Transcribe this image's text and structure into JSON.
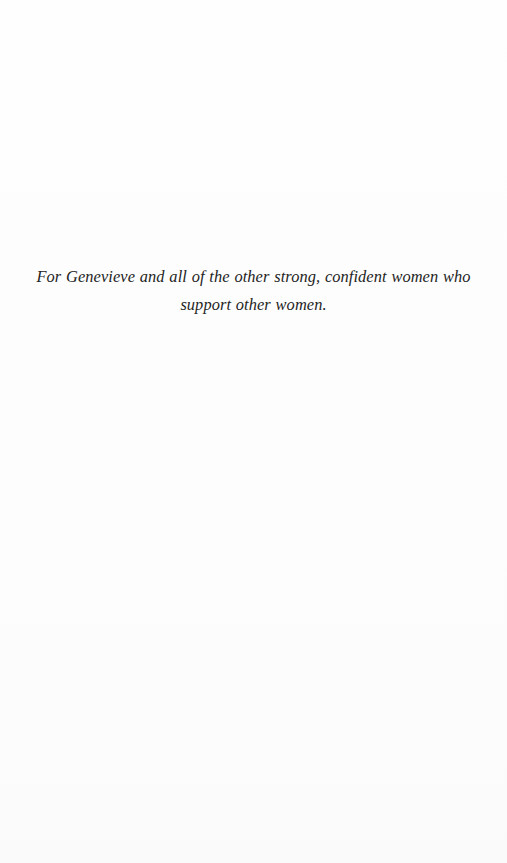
{
  "page": {
    "type": "book-dedication-page",
    "background_color": "#fdfdfd",
    "text_color": "#242424"
  },
  "dedication": {
    "text": "For Genevieve and all of the other strong, confident women who support other women.",
    "line_1": "For Genevieve and all of the other strong, confident women who support",
    "line_2": "other women."
  }
}
